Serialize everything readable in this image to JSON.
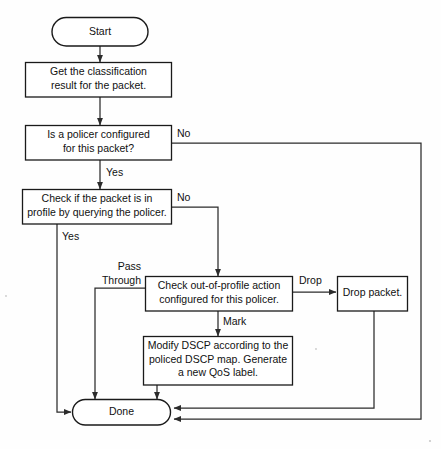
{
  "diagram": {
    "background_color": "#fefefe",
    "line_color": "#2b2b2b",
    "text_color": "#111111",
    "box_fill": "#ffffff"
  },
  "nodes": {
    "start": {
      "shape": "terminator",
      "label": "Start"
    },
    "classify": {
      "shape": "process",
      "line1": "Get the classification",
      "line2": "result for the packet."
    },
    "policer_check": {
      "shape": "process",
      "line1": "Is a policer configured",
      "line2": "for this packet?"
    },
    "profile_check": {
      "shape": "process",
      "line1": "Check if the packet is in",
      "line2": "profile by querying the policer."
    },
    "out_of_profile_action": {
      "shape": "process",
      "line1": "Check out-of-profile action",
      "line2": "configured for this policer."
    },
    "drop_packet": {
      "shape": "process",
      "line1": "Drop packet."
    },
    "modify_dscp": {
      "shape": "process",
      "line1": "Modify DSCP according to the",
      "line2": "policed DSCP map. Generate",
      "line3": "a new QoS label."
    },
    "done": {
      "shape": "terminator",
      "label": "Done"
    }
  },
  "edge_labels": {
    "policer_no": "No",
    "policer_yes": "Yes",
    "profile_no": "No",
    "profile_yes": "Yes",
    "pass_line1": "Pass",
    "pass_line2": "Through",
    "drop": "Drop",
    "mark": "Mark"
  }
}
